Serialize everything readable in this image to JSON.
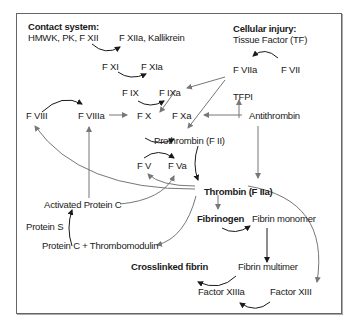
{
  "diagram": {
    "nodes": {
      "contact_header": "Contact system:",
      "contact_factors": "HMWK, PK, F XII",
      "f12a_kallikrein": "F XIIa, Kallikrein",
      "cell_header": "Cellular injury:",
      "tissue_factor": "Tissue Factor (TF)",
      "f11": "F XI",
      "f11a": "F XIa",
      "f9": "F IX",
      "f9a": "F IXa",
      "f7a": "F VIIa",
      "f7": "F VII",
      "tfpi": "TFPI",
      "f8": "F VIII",
      "f8a": "F VIIIa",
      "f10": "F X",
      "f10a": "F Xa",
      "antithrombin": "Antithrombin",
      "prothrombin": "Prothrombin (F II)",
      "f5": "F V",
      "f5a": "F Va",
      "apc": "Activated Protein C",
      "thrombin": "Thrombin (F IIa)",
      "protein_s": "Protein S",
      "fibrinogen": "Fibrinogen",
      "fibrin_monomer": "Fibrin monomer",
      "protein_c_tm": "Protein C + Thrombomodulin",
      "crosslinked_fibrin": "Crosslinked fibrin",
      "fibrin_multimer": "Fibrin multimer",
      "f13a": "Factor XIIIa",
      "f13": "Factor XIII"
    },
    "colors": {
      "arrow_dark": "#1a1a1a",
      "arrow_gray": "#777777",
      "border": "#666666"
    }
  }
}
